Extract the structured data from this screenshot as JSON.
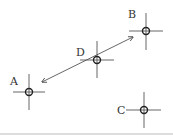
{
  "diagram": {
    "points": [
      {
        "id": "A",
        "label": "A",
        "cx": 29,
        "cy": 92,
        "lx": 10,
        "ly": 85
      },
      {
        "id": "B",
        "label": "B",
        "cx": 146,
        "cy": 31,
        "lx": 128,
        "ly": 18
      },
      {
        "id": "C",
        "label": "C",
        "cx": 144,
        "cy": 110,
        "lx": 117,
        "ly": 114
      },
      {
        "id": "D",
        "label": "D",
        "cx": 97,
        "cy": 60,
        "lx": 76,
        "ly": 56
      }
    ],
    "arrow": {
      "from": "A",
      "to": "B",
      "double_headed": true
    },
    "colors": {
      "stroke": "#333333",
      "line": "#555555",
      "bottom_rule": "#bbbbbb"
    }
  }
}
